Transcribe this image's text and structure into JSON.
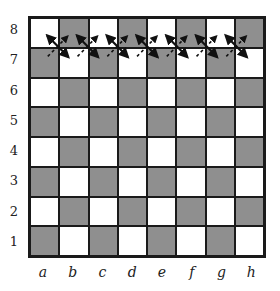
{
  "diagram": {
    "type": "chessboard",
    "colors": {
      "light_square": "#ffffff",
      "dark_square": "#8f8f8f",
      "lines": "#1a1a1a"
    },
    "ranks": [
      "8",
      "7",
      "6",
      "5",
      "4",
      "3",
      "2",
      "1"
    ],
    "files": [
      "a",
      "b",
      "c",
      "d",
      "e",
      "f",
      "g",
      "h"
    ],
    "top_left_square": "light",
    "solid_arrows": [
      {
        "from": "a8",
        "to": "b7",
        "heads": "both"
      },
      {
        "from": "b8",
        "to": "c7",
        "heads": "both"
      },
      {
        "from": "c8",
        "to": "d7",
        "heads": "both"
      },
      {
        "from": "d8",
        "to": "e7",
        "heads": "both"
      },
      {
        "from": "e8",
        "to": "f7",
        "heads": "both"
      },
      {
        "from": "f8",
        "to": "g7",
        "heads": "both"
      },
      {
        "from": "g8",
        "to": "h7",
        "heads": "both"
      }
    ],
    "dashed_arrows": [
      {
        "from": "a7",
        "to": "b8"
      },
      {
        "from": "b7",
        "to": "c8"
      },
      {
        "from": "c7",
        "to": "d8"
      },
      {
        "from": "d7",
        "to": "e8"
      },
      {
        "from": "e7",
        "to": "f8"
      },
      {
        "from": "f7",
        "to": "g8"
      },
      {
        "from": "g7",
        "to": "h8"
      }
    ]
  }
}
